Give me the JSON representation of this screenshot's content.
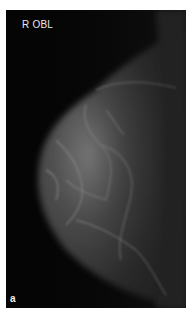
{
  "image": {
    "type": "mammogram",
    "view_label": "R OBL",
    "panel_label": "a",
    "colors": {
      "background": "#050505",
      "border": "#ffffff",
      "label": "#e8e8e8"
    }
  }
}
